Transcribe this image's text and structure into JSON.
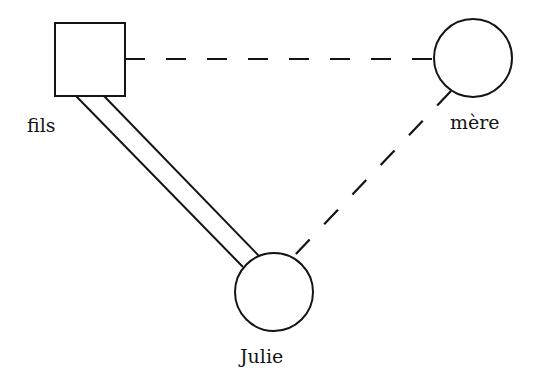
{
  "diagram": {
    "type": "relationship-diagram",
    "nodes": [
      {
        "id": "fils",
        "label": "fils",
        "shape": "square"
      },
      {
        "id": "mere",
        "label": "mère",
        "shape": "circle"
      },
      {
        "id": "julie",
        "label": "Julie",
        "shape": "circle"
      }
    ],
    "edges": [
      {
        "from": "fils",
        "to": "mere",
        "style": "dashed"
      },
      {
        "from": "mere",
        "to": "julie",
        "style": "dashed"
      },
      {
        "from": "fils",
        "to": "julie",
        "style": "double-solid"
      }
    ],
    "colors": {
      "stroke": "#141414",
      "background": "#ffffff"
    }
  }
}
